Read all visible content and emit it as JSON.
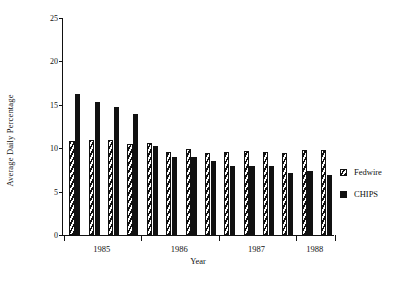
{
  "chart_data": {
    "type": "bar",
    "title": "",
    "xlabel": "Year",
    "ylabel": "Average Daily Percentage",
    "ylim": [
      0,
      25
    ],
    "yticks": [
      0,
      5,
      10,
      15,
      20,
      25
    ],
    "grid": false,
    "legend_position": "right",
    "categories": [
      "1985 Q1",
      "1985 Q2",
      "1985 Q3",
      "1985 Q4",
      "1986 Q1",
      "1986 Q2",
      "1986 Q3",
      "1986 Q4",
      "1987 Q1",
      "1987 Q2",
      "1987 Q3",
      "1987 Q4",
      "1988 Q1",
      "1988 Q2"
    ],
    "group_labels": [
      "1985",
      "1986",
      "1987",
      "1988"
    ],
    "group_sizes": [
      4,
      4,
      4,
      2
    ],
    "series": [
      {
        "name": "Fedwire",
        "fill": "hatched",
        "color": "#111111",
        "values": [
          10.8,
          11.0,
          10.9,
          10.5,
          10.6,
          9.6,
          9.9,
          9.5,
          9.6,
          9.7,
          9.6,
          9.5,
          9.8,
          9.8
        ]
      },
      {
        "name": "CHIPS",
        "fill": "solid",
        "color": "#111111",
        "values": [
          16.3,
          15.3,
          14.7,
          13.9,
          10.3,
          9.0,
          9.0,
          8.5,
          8.0,
          7.9,
          7.9,
          7.1,
          7.4,
          6.9
        ]
      }
    ]
  },
  "axis": {
    "y_label": "Average Daily Percentage",
    "x_label": "Year",
    "y_ticks": [
      "0",
      "5",
      "10",
      "15",
      "20",
      "25"
    ],
    "x_group_labels": [
      "1985",
      "1986",
      "1987",
      "1988"
    ]
  },
  "legend": {
    "entries": [
      {
        "label": "Fedwire",
        "swatch": "hatched-square-icon"
      },
      {
        "label": "CHIPS",
        "swatch": "filled-square-icon"
      }
    ]
  }
}
